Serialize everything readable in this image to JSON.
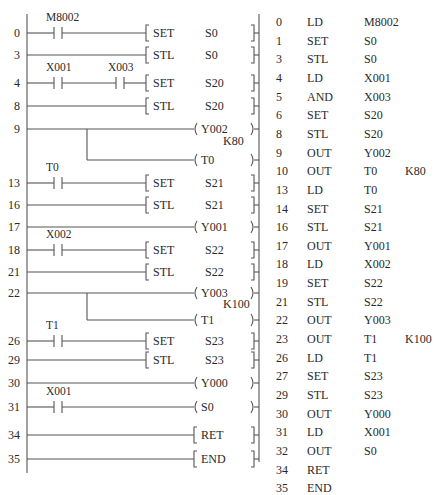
{
  "ladder": {
    "colors": {
      "line": "#555555",
      "text": "#2a2a2a"
    },
    "rails": {
      "left_x": 27,
      "right_x": 259,
      "top_y": 14,
      "left_bottom_y": 473,
      "right_bottom_y": 462
    },
    "rungs": [
      {
        "step": "0",
        "y": 33,
        "contacts": [
          {
            "label": "M8002",
            "x": 58
          }
        ],
        "type": "set",
        "instr": "SET",
        "operand": "S0"
      },
      {
        "step": "3",
        "y": 55,
        "contacts": [],
        "type": "set",
        "instr": "STL",
        "operand": "S0"
      },
      {
        "step": "4",
        "y": 83,
        "contacts": [
          {
            "label": "X001",
            "x": 58
          },
          {
            "label": "X003",
            "x": 120
          }
        ],
        "type": "set",
        "instr": "SET",
        "operand": "S20"
      },
      {
        "step": "8",
        "y": 106,
        "contacts": [],
        "type": "set",
        "instr": "STL",
        "operand": "S20"
      },
      {
        "step": "9",
        "y": 129,
        "contacts": [],
        "type": "coil",
        "operand": "Y002"
      },
      {
        "step": "",
        "y": 160,
        "contacts": [],
        "type": "coil",
        "operand": "T0",
        "branch_from_y": 129,
        "branch_x": 87,
        "preset": "K80",
        "preset_y": 141
      },
      {
        "step": "13",
        "y": 183,
        "contacts": [
          {
            "label": "T0",
            "x": 58
          }
        ],
        "type": "set",
        "instr": "SET",
        "operand": "S21"
      },
      {
        "step": "16",
        "y": 205,
        "contacts": [],
        "type": "set",
        "instr": "STL",
        "operand": "S21"
      },
      {
        "step": "17",
        "y": 227,
        "contacts": [],
        "type": "coil",
        "operand": "Y001"
      },
      {
        "step": "18",
        "y": 250,
        "contacts": [
          {
            "label": "X002",
            "x": 58
          }
        ],
        "type": "set",
        "instr": "SET",
        "operand": "S22"
      },
      {
        "step": "21",
        "y": 272,
        "contacts": [],
        "type": "set",
        "instr": "STL",
        "operand": "S22"
      },
      {
        "step": "22",
        "y": 293,
        "contacts": [],
        "type": "coil",
        "operand": "Y003"
      },
      {
        "step": "",
        "y": 320,
        "contacts": [],
        "type": "coil",
        "operand": "T1",
        "branch_from_y": 293,
        "branch_x": 87,
        "preset": "K100",
        "preset_y": 304
      },
      {
        "step": "26",
        "y": 341,
        "contacts": [
          {
            "label": "T1",
            "x": 58
          }
        ],
        "type": "set",
        "instr": "SET",
        "operand": "S23"
      },
      {
        "step": "29",
        "y": 360,
        "contacts": [],
        "type": "set",
        "instr": "STL",
        "operand": "S23"
      },
      {
        "step": "30",
        "y": 383,
        "contacts": [],
        "type": "coil",
        "operand": "Y000"
      },
      {
        "step": "31",
        "y": 407,
        "contacts": [
          {
            "label": "X001",
            "x": 58
          }
        ],
        "type": "coil",
        "operand": "S0"
      },
      {
        "step": "34",
        "y": 435,
        "contacts": [],
        "type": "func",
        "instr": "RET"
      },
      {
        "step": "35",
        "y": 459,
        "contacts": [],
        "type": "func",
        "instr": "END"
      }
    ]
  },
  "instruction_list": {
    "rows": [
      {
        "step": "0",
        "op": "LD",
        "operand": "M8002",
        "k": ""
      },
      {
        "step": "1",
        "op": "SET",
        "operand": "S0",
        "k": ""
      },
      {
        "step": "3",
        "op": "STL",
        "operand": "S0",
        "k": ""
      },
      {
        "step": "4",
        "op": "LD",
        "operand": "X001",
        "k": ""
      },
      {
        "step": "5",
        "op": "AND",
        "operand": "X003",
        "k": ""
      },
      {
        "step": "6",
        "op": "SET",
        "operand": "S20",
        "k": ""
      },
      {
        "step": "8",
        "op": "STL",
        "operand": "S20",
        "k": ""
      },
      {
        "step": "9",
        "op": "OUT",
        "operand": "Y002",
        "k": ""
      },
      {
        "step": "10",
        "op": "OUT",
        "operand": "T0",
        "k": "K80"
      },
      {
        "step": "13",
        "op": "LD",
        "operand": "T0",
        "k": ""
      },
      {
        "step": "14",
        "op": "SET",
        "operand": "S21",
        "k": ""
      },
      {
        "step": "16",
        "op": "STL",
        "operand": "S21",
        "k": ""
      },
      {
        "step": "17",
        "op": "OUT",
        "operand": "Y001",
        "k": ""
      },
      {
        "step": "18",
        "op": "LD",
        "operand": "X002",
        "k": ""
      },
      {
        "step": "19",
        "op": "SET",
        "operand": "S22",
        "k": ""
      },
      {
        "step": "21",
        "op": "STL",
        "operand": "S22",
        "k": ""
      },
      {
        "step": "22",
        "op": "OUT",
        "operand": "Y003",
        "k": ""
      },
      {
        "step": "23",
        "op": "OUT",
        "operand": "T1",
        "k": "K100"
      },
      {
        "step": "26",
        "op": "LD",
        "operand": "T1",
        "k": ""
      },
      {
        "step": "27",
        "op": "SET",
        "operand": "S23",
        "k": ""
      },
      {
        "step": "29",
        "op": "STL",
        "operand": "S23",
        "k": ""
      },
      {
        "step": "30",
        "op": "OUT",
        "operand": "Y000",
        "k": ""
      },
      {
        "step": "31",
        "op": "LD",
        "operand": "X001",
        "k": ""
      },
      {
        "step": "32",
        "op": "OUT",
        "operand": "S0",
        "k": ""
      },
      {
        "step": "34",
        "op": "RET",
        "operand": "",
        "k": ""
      },
      {
        "step": "35",
        "op": "END",
        "operand": "",
        "k": ""
      }
    ],
    "row_start_y": 14,
    "row_height": 18.65,
    "cols": {
      "step_x": 276,
      "op_x": 307,
      "operand_x": 364,
      "k_x": 405
    }
  }
}
